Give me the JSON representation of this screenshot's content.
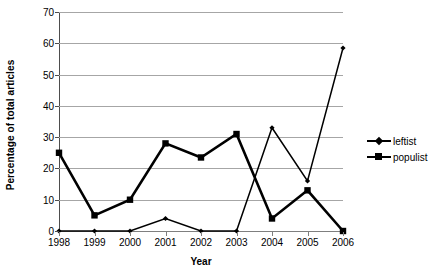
{
  "chart_data": {
    "type": "line",
    "title": "",
    "xlabel": "Year",
    "ylabel": "Percentage of total articles",
    "categories": [
      "1998",
      "1999",
      "2000",
      "2001",
      "2002",
      "2003",
      "2004",
      "2005",
      "2006"
    ],
    "x": [
      1998,
      1999,
      2000,
      2001,
      2002,
      2003,
      2004,
      2005,
      2006
    ],
    "ylim": [
      0,
      70
    ],
    "yticks": [
      0,
      10,
      20,
      30,
      40,
      50,
      60,
      70
    ],
    "ytick_labels": [
      "0",
      "10",
      "20",
      "30",
      "40",
      "50",
      "60",
      "70"
    ],
    "grid": true,
    "legend_position": "right",
    "series": [
      {
        "name": "leftist",
        "marker": "diamond",
        "color": "#000000",
        "values": [
          0,
          0,
          0,
          4,
          0,
          0,
          33,
          16,
          58.5
        ]
      },
      {
        "name": "populist",
        "marker": "square",
        "color": "#000000",
        "values": [
          25,
          5,
          10,
          28,
          23.5,
          31,
          4,
          13,
          0
        ]
      }
    ]
  },
  "legend": {
    "items": [
      {
        "label": "leftist",
        "marker": "diamond"
      },
      {
        "label": "populist",
        "marker": "square"
      }
    ]
  }
}
